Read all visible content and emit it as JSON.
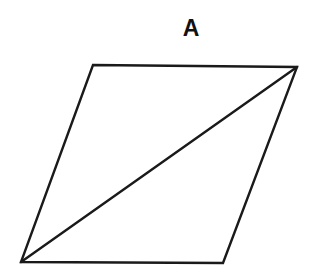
{
  "figure": {
    "label": "A",
    "shape": "parallelogram",
    "stroke_color": "#1a1a1a",
    "background": "#ffffff",
    "vertices": {
      "top_left": [
        93,
        65
      ],
      "top_right": [
        297,
        67
      ],
      "bottom_right": [
        223,
        263
      ],
      "bottom_left": [
        21,
        262
      ]
    },
    "diagonal": {
      "from": "bottom_left",
      "to": "top_right"
    }
  }
}
